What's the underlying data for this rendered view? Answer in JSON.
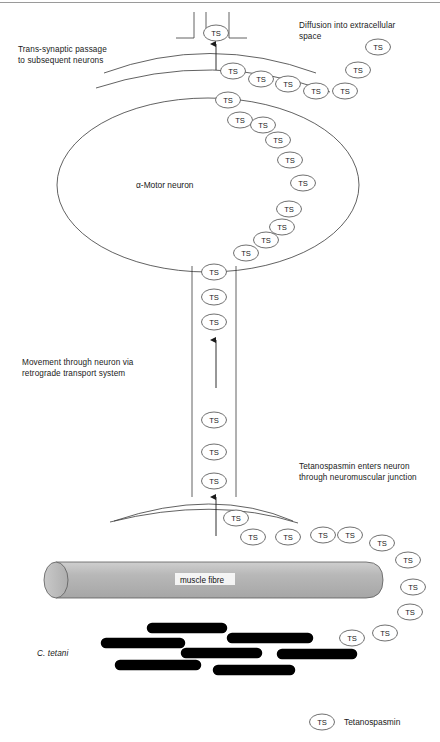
{
  "figure": {
    "ts_abbrev": "TS"
  },
  "annotations": {
    "trans_synaptic": "Trans-synaptic passage\nto subsequent neurons",
    "diffusion": "Diffusion into extracellular\nspace",
    "movement": "Movement through neuron via\nretrograde transport system",
    "entry": "Tetanospasmin enters neuron\nthrough neuromuscular junction",
    "cell_body_label": "α-Motor neuron",
    "muscle_label": "muscle fibre",
    "bacteria_label": "C. tetani"
  },
  "legend": {
    "symbol": "TS",
    "label": "Tetanospasmin"
  },
  "colors": {
    "outline": "#3a3a3a",
    "ts_outline": "#4a4a4a",
    "bacterium": "#000000",
    "muscle_fill": "#b3b3b3",
    "muscle_stroke": "#4a4a4a",
    "text": "#1a1a1a",
    "background": "#ffffff",
    "top_rule": "#9a9a9a"
  },
  "chart_data": {
    "type": "diagram",
    "ts_particles": [
      {
        "id": "ts-synapse-top",
        "x": 216,
        "y": 33,
        "group": "synaptic-terminal"
      },
      {
        "id": "ts-cleft-1",
        "x": 233,
        "y": 71,
        "group": "diffusion-chain"
      },
      {
        "id": "ts-cleft-2",
        "x": 261,
        "y": 79,
        "group": "diffusion-chain"
      },
      {
        "id": "ts-cleft-3",
        "x": 288,
        "y": 84,
        "group": "diffusion-chain"
      },
      {
        "id": "ts-cleft-4",
        "x": 316,
        "y": 91,
        "group": "diffusion-chain"
      },
      {
        "id": "ts-cleft-5",
        "x": 345,
        "y": 91,
        "group": "diffusion-chain"
      },
      {
        "id": "ts-diff-1",
        "x": 358,
        "y": 70,
        "group": "diffusion-chain"
      },
      {
        "id": "ts-diff-2",
        "x": 378,
        "y": 47,
        "group": "diffusion-chain"
      },
      {
        "id": "ts-soma-1",
        "x": 228,
        "y": 100,
        "group": "soma-chain"
      },
      {
        "id": "ts-soma-2",
        "x": 240,
        "y": 120,
        "group": "soma-chain"
      },
      {
        "id": "ts-soma-3",
        "x": 263,
        "y": 125,
        "group": "soma-chain"
      },
      {
        "id": "ts-soma-4",
        "x": 278,
        "y": 140,
        "group": "soma-chain"
      },
      {
        "id": "ts-soma-5",
        "x": 290,
        "y": 160,
        "group": "soma-chain"
      },
      {
        "id": "ts-soma-6",
        "x": 303,
        "y": 183,
        "group": "soma-chain"
      },
      {
        "id": "ts-soma-7",
        "x": 289,
        "y": 209,
        "group": "soma-chain"
      },
      {
        "id": "ts-soma-8",
        "x": 282,
        "y": 227,
        "group": "soma-chain"
      },
      {
        "id": "ts-soma-9",
        "x": 266,
        "y": 240,
        "group": "soma-chain"
      },
      {
        "id": "ts-soma-10",
        "x": 246,
        "y": 253,
        "group": "soma-chain"
      },
      {
        "id": "ts-axon-1",
        "x": 214,
        "y": 272,
        "group": "axon"
      },
      {
        "id": "ts-axon-2",
        "x": 214,
        "y": 297,
        "group": "axon"
      },
      {
        "id": "ts-axon-3",
        "x": 214,
        "y": 322,
        "group": "axon"
      },
      {
        "id": "ts-axon-4",
        "x": 214,
        "y": 420,
        "group": "axon"
      },
      {
        "id": "ts-axon-5",
        "x": 214,
        "y": 452,
        "group": "axon"
      },
      {
        "id": "ts-axon-6",
        "x": 214,
        "y": 481,
        "group": "axon"
      },
      {
        "id": "ts-nmj-1",
        "x": 236,
        "y": 518,
        "group": "nmj-chain"
      },
      {
        "id": "ts-nmj-2",
        "x": 253,
        "y": 537,
        "group": "nmj-chain"
      },
      {
        "id": "ts-nmj-3",
        "x": 288,
        "y": 537,
        "group": "nmj-chain"
      },
      {
        "id": "ts-nmj-4",
        "x": 323,
        "y": 535,
        "group": "nmj-chain"
      },
      {
        "id": "ts-nmj-5",
        "x": 350,
        "y": 535,
        "group": "nmj-chain"
      },
      {
        "id": "ts-nmj-6",
        "x": 382,
        "y": 543,
        "group": "nmj-chain"
      },
      {
        "id": "ts-nmj-7",
        "x": 408,
        "y": 560,
        "group": "nmj-chain"
      },
      {
        "id": "ts-nmj-8",
        "x": 413,
        "y": 587,
        "group": "nmj-chain"
      },
      {
        "id": "ts-nmj-9",
        "x": 410,
        "y": 612,
        "group": "nmj-chain"
      },
      {
        "id": "ts-bact-1",
        "x": 385,
        "y": 633,
        "group": "bacteria-release"
      },
      {
        "id": "ts-bact-2",
        "x": 352,
        "y": 638,
        "group": "bacteria-release"
      }
    ],
    "bacteria": [
      {
        "x1": 152,
        "y1": 628,
        "x2": 222,
        "y2": 628
      },
      {
        "x1": 106,
        "y1": 643,
        "x2": 180,
        "y2": 643
      },
      {
        "x1": 232,
        "y1": 638,
        "x2": 308,
        "y2": 638
      },
      {
        "x1": 186,
        "y1": 653,
        "x2": 257,
        "y2": 653
      },
      {
        "x1": 120,
        "y1": 665,
        "x2": 196,
        "y2": 665
      },
      {
        "x1": 282,
        "y1": 654,
        "x2": 352,
        "y2": 654
      },
      {
        "x1": 218,
        "y1": 670,
        "x2": 290,
        "y2": 670
      }
    ],
    "structures": [
      {
        "name": "synaptic-terminal",
        "type": "curve",
        "y": 55
      },
      {
        "name": "soma",
        "type": "ellipse",
        "cx": 208,
        "cy": 185,
        "rx": 151,
        "ry": 87
      },
      {
        "name": "axon",
        "type": "rect",
        "x": 192,
        "y": 265,
        "w": 44,
        "h": 230
      },
      {
        "name": "nmj-terminal",
        "type": "curve",
        "y": 500
      },
      {
        "name": "muscle-fibre",
        "type": "cylinder",
        "x": 38,
        "y": 562,
        "w": 345,
        "h": 36
      }
    ]
  }
}
